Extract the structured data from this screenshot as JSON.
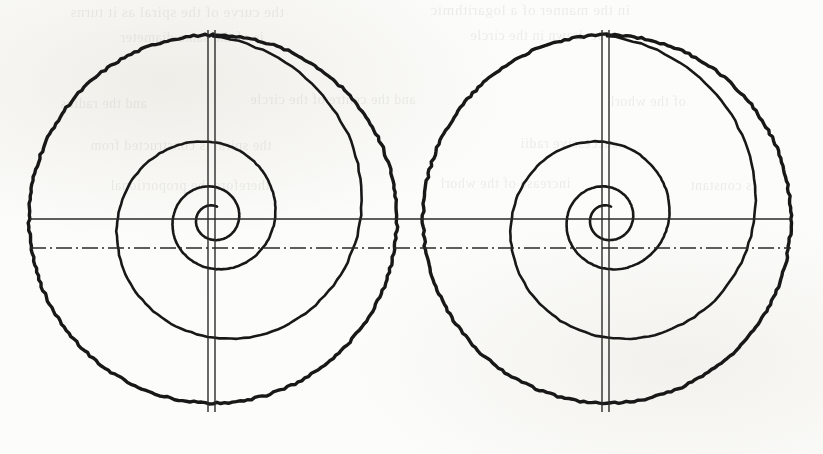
{
  "page": {
    "kind": "scanned-book-page-figure",
    "background_color": "#fdfdfb",
    "ink_color": "#1a1a1a",
    "width": 823,
    "height": 454
  },
  "ghost_text": {
    "note": "faint mirrored bleed-through from the reverse side of the page; largely illegible",
    "lines": [
      {
        "text": "the curve of the spiral as it turns",
        "x": 70,
        "y": 4,
        "size": 15
      },
      {
        "text": "in the manner of a logarithmic",
        "x": 430,
        "y": 2,
        "size": 15
      },
      {
        "text": "is of the same diameter",
        "x": 120,
        "y": 30,
        "size": 14
      },
      {
        "text": "be drawn in the circle",
        "x": 470,
        "y": 28,
        "size": 14
      },
      {
        "text": "and the radius",
        "x": 60,
        "y": 96,
        "size": 14
      },
      {
        "text": "and the centre of the circle",
        "x": 250,
        "y": 92,
        "size": 14
      },
      {
        "text": "of the whorl",
        "x": 610,
        "y": 94,
        "size": 14
      },
      {
        "text": "the spiral is constructed from",
        "x": 90,
        "y": 138,
        "size": 14
      },
      {
        "text": "successive radii",
        "x": 520,
        "y": 136,
        "size": 14
      },
      {
        "text": "therefore the proportional",
        "x": 110,
        "y": 178,
        "size": 14
      },
      {
        "text": "increase of the whorl",
        "x": 440,
        "y": 176,
        "size": 14
      },
      {
        "text": "is constant",
        "x": 690,
        "y": 178,
        "size": 14
      }
    ]
  },
  "figure": {
    "panels": [
      {
        "id": "left",
        "name": "left-spiral-figure",
        "center_x": 213,
        "center_y": 219,
        "outer_radius": 184,
        "baseline_y": 248
      },
      {
        "id": "right",
        "name": "right-spiral-figure",
        "center_x": 607,
        "center_y": 219,
        "outer_radius": 184,
        "baseline_y": 248
      }
    ],
    "construction_lines": {
      "horizontal_solid": {
        "y": 219,
        "x_start": 30,
        "x_end": 791,
        "style": "solid"
      },
      "horizontal_centre": {
        "y": 248,
        "x_start": 30,
        "x_end": 791,
        "style": "dash-dot"
      },
      "vertical_pairs": [
        {
          "x_left": 208,
          "x_right": 215,
          "y_top": 30,
          "y_bottom": 412
        },
        {
          "x_left": 602,
          "x_right": 609,
          "y_top": 30,
          "y_bottom": 412
        }
      ]
    },
    "spiral": {
      "type": "logarithmic",
      "turns": 3.05,
      "start_angle_deg": -90,
      "start_radius": 184,
      "end_radius": 13,
      "line_weight_outer": 3.4,
      "line_weight_inner": 2.6
    }
  },
  "colors": {
    "ink": "#181818",
    "ink_soft": "#2a2a2a",
    "paper": "#fdfdfb",
    "ghost": "#4a4a46"
  }
}
